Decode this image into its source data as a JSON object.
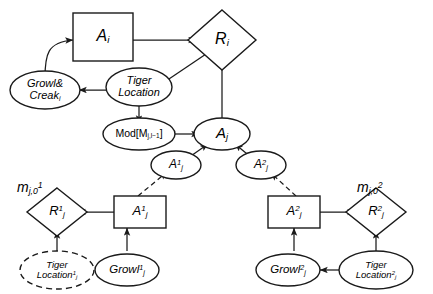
{
  "diagram": {
    "width": 433,
    "height": 294,
    "stroke_color": "#1a1a1a",
    "background_color": "#ffffff"
  },
  "nodes": {
    "a_i": {
      "label": "A",
      "sub": "i",
      "sup": "",
      "shape": "rect"
    },
    "r_i": {
      "label": "R",
      "sub": "i",
      "sup": "",
      "shape": "diamond"
    },
    "growl_creak_i": {
      "line1": "Growl&",
      "line2": "Creak",
      "sub": "i",
      "shape": "ellipse"
    },
    "tiger_location": {
      "line1": "Tiger",
      "line2": "Location",
      "shape": "ellipse"
    },
    "mod": {
      "label": "Mod[M",
      "sub": "j,l−1",
      "tail": "]",
      "shape": "ellipse"
    },
    "a_j": {
      "label": "A",
      "sub": "j",
      "sup": "",
      "shape": "ellipse"
    },
    "a_j_prime_1": {
      "label": "A",
      "sub": "j",
      "sup": "1",
      "shape": "ellipse"
    },
    "a_j_prime_2": {
      "label": "A",
      "sub": "j",
      "sup": "2",
      "shape": "ellipse"
    },
    "m_label_1": {
      "label": "m",
      "sub": "j,0",
      "sup": "1"
    },
    "m_label_2": {
      "label": "m",
      "sub": "j,0",
      "sup": "2"
    },
    "r1_j": {
      "label": "R",
      "sub": "j",
      "sup": "1",
      "shape": "diamond"
    },
    "a1_j": {
      "label": "A",
      "sub": "j",
      "sup": "1",
      "shape": "rect"
    },
    "tiger_location_1": {
      "line1": "Tiger",
      "line2": "Location",
      "sub": "j",
      "sup": "1",
      "shape": "ellipse-dashed"
    },
    "growl_1_j": {
      "label": "Growl",
      "sub": "j",
      "sup": "1",
      "shape": "ellipse"
    },
    "r2_j": {
      "label": "R",
      "sub": "j",
      "sup": "2",
      "shape": "diamond"
    },
    "a2_j": {
      "label": "A",
      "sub": "j",
      "sup": "2",
      "shape": "rect"
    },
    "tiger_location_2": {
      "line1": "Tiger",
      "line2": "Location",
      "sub": "j",
      "sup": "2",
      "shape": "ellipse"
    },
    "growl_2_j": {
      "label": "Growl",
      "sub": "j",
      "sup": "2",
      "shape": "ellipse"
    }
  },
  "edges": [
    {
      "from": "growl_creak_i",
      "to": "a_i",
      "style": "solid-curved"
    },
    {
      "from": "a_i",
      "to": "r_i",
      "style": "solid"
    },
    {
      "from": "tiger_location",
      "to": "r_i",
      "style": "solid"
    },
    {
      "from": "tiger_location",
      "to": "growl_creak_i",
      "style": "solid"
    },
    {
      "from": "tiger_location",
      "to": "mod",
      "style": "solid"
    },
    {
      "from": "mod",
      "to": "a_j",
      "style": "solid"
    },
    {
      "from": "a_j",
      "to": "r_i",
      "style": "solid"
    },
    {
      "from": "a_j_prime_1",
      "to": "a_j",
      "style": "solid"
    },
    {
      "from": "a_j_prime_2",
      "to": "a_j",
      "style": "solid"
    },
    {
      "from": "a1_j",
      "to": "a_j_prime_1",
      "style": "dashed"
    },
    {
      "from": "a2_j",
      "to": "a_j_prime_2",
      "style": "dashed"
    },
    {
      "from": "a1_j",
      "to": "r1_j",
      "style": "solid"
    },
    {
      "from": "growl_1_j",
      "to": "a1_j",
      "style": "solid"
    },
    {
      "from": "tiger_location_1",
      "to": "r1_j",
      "style": "solid"
    },
    {
      "from": "tiger_location_1",
      "to": "growl_1_j",
      "style": "solid"
    },
    {
      "from": "a2_j",
      "to": "r2_j",
      "style": "solid"
    },
    {
      "from": "growl_2_j",
      "to": "a2_j",
      "style": "solid"
    },
    {
      "from": "tiger_location_2",
      "to": "r2_j",
      "style": "solid"
    },
    {
      "from": "tiger_location_2",
      "to": "growl_2_j",
      "style": "solid"
    }
  ]
}
